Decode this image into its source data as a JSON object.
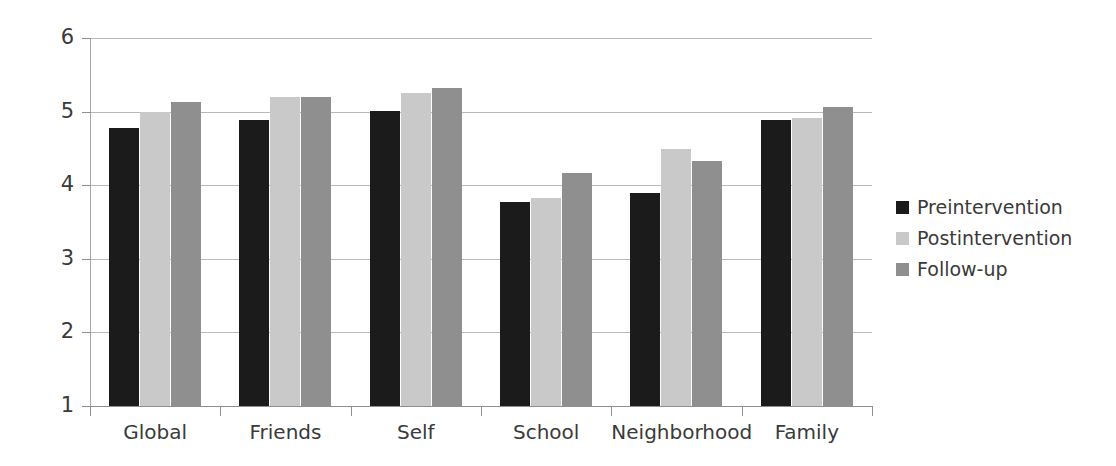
{
  "chart_data": {
    "type": "bar",
    "title": "",
    "subtitle": "",
    "xlabel": "",
    "ylabel": "",
    "categories": [
      "Global",
      "Friends",
      "Self",
      "School",
      "Neighborhood",
      "Family"
    ],
    "series": [
      {
        "name": "Preintervention",
        "color": "#1b1b1b",
        "values": [
          4.78,
          4.89,
          5.01,
          3.77,
          3.89,
          4.88
        ]
      },
      {
        "name": "Postintervention",
        "color": "#c9c9c9",
        "values": [
          5.0,
          5.2,
          5.25,
          3.82,
          4.49,
          4.92
        ]
      },
      {
        "name": "Follow-up",
        "color": "#8f8f8f",
        "values": [
          5.13,
          5.2,
          5.32,
          4.17,
          4.33,
          5.06
        ]
      }
    ],
    "ylim": [
      1,
      6
    ],
    "yticks": [
      1,
      2,
      3,
      4,
      5,
      6
    ],
    "ytick_labels": [
      "1",
      "2",
      "3",
      "4",
      "5",
      "6"
    ],
    "grid": "horizontal",
    "legend_position": "right",
    "background_color": "#ffffff",
    "axis_color": "#8f8f8f",
    "grid_color": "#b9b9b9"
  },
  "legend": {
    "items": [
      {
        "label": "Preintervention",
        "swatch": "legend-swatch-preintervention"
      },
      {
        "label": "Postintervention",
        "swatch": "legend-swatch-postintervention"
      },
      {
        "label": "Follow-up",
        "swatch": "legend-swatch-followup"
      }
    ]
  }
}
